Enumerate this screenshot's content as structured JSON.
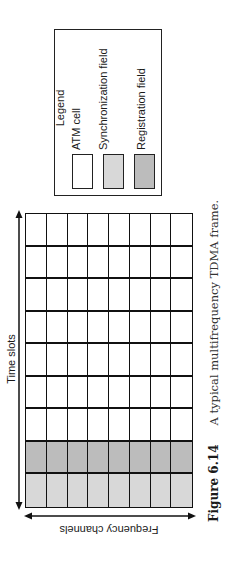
{
  "legend": {
    "title": "Legend",
    "items": [
      {
        "label": "ATM cell",
        "color": "#ffffff"
      },
      {
        "label": "Synchronization field",
        "color": "#d8d8d8"
      },
      {
        "label": "Registration field",
        "color": "#bcbcbc"
      }
    ]
  },
  "axes": {
    "time_label": "Time slots",
    "frequency_label": "Frequency channels"
  },
  "grid": {
    "columns": 8,
    "rows": 9,
    "row_types": [
      "atm",
      "atm",
      "atm",
      "atm",
      "atm",
      "atm",
      "atm",
      "registration",
      "synchronization"
    ]
  },
  "caption": {
    "figure_number": "Figure 6.14",
    "text": "A typical multifrequency TDMA frame."
  },
  "colors": {
    "atm": "#ffffff",
    "synchronization": "#d8d8d8",
    "registration": "#bcbcbc",
    "line": "#111111"
  }
}
